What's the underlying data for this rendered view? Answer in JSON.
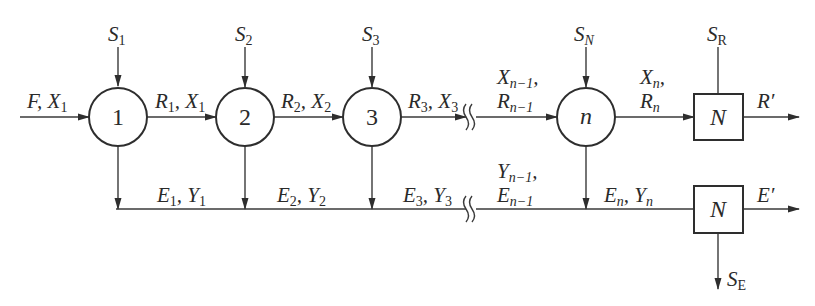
{
  "diagram": {
    "type": "multistage cross-current extraction flow diagram",
    "stages": [
      {
        "id": "1",
        "label": "1",
        "solvent": {
          "base": "S",
          "sub": "1"
        }
      },
      {
        "id": "2",
        "label": "2",
        "solvent": {
          "base": "S",
          "sub": "2"
        }
      },
      {
        "id": "3",
        "label": "3",
        "solvent": {
          "base": "S",
          "sub": "3"
        }
      },
      {
        "id": "n",
        "label": "n",
        "solvent": {
          "base": "S",
          "sub": "N"
        }
      }
    ],
    "feed": {
      "text": "F, X",
      "sub": "1"
    },
    "raffinate_streams": [
      {
        "a": "R",
        "a_sub": "1",
        "b": "X",
        "b_sub": "1"
      },
      {
        "a": "R",
        "a_sub": "2",
        "b": "X",
        "b_sub": "2"
      },
      {
        "a": "R",
        "a_sub": "3",
        "b": "X",
        "b_sub": "3"
      }
    ],
    "raffinate_n_minus_1": {
      "line1": "X",
      "line1_sub": "n−1",
      "line2": "R",
      "line2_sub": "n−1"
    },
    "raffinate_n": {
      "line1": "X",
      "line1_sub": "n",
      "line2": "R",
      "line2_sub": "n"
    },
    "extract_streams": [
      {
        "a": "E",
        "a_sub": "1",
        "b": "Y",
        "b_sub": "1"
      },
      {
        "a": "E",
        "a_sub": "2",
        "b": "Y",
        "b_sub": "2"
      },
      {
        "a": "E",
        "a_sub": "3",
        "b": "Y",
        "b_sub": "3"
      }
    ],
    "extract_n_minus_1": {
      "line1": "Y",
      "line1_sub": "n−1",
      "line2": "E",
      "line2_sub": "n−1"
    },
    "extract_n": {
      "a": "E",
      "a_sub": "n",
      "b": "Y",
      "b_sub": "n"
    },
    "raffinate_recovery": {
      "box_label": "N",
      "solvent_out": {
        "base": "S",
        "sub": "R"
      },
      "product": "R′"
    },
    "extract_recovery": {
      "box_label": "N",
      "solvent_out": {
        "base": "S",
        "sub": "E"
      },
      "product": "E′"
    }
  }
}
